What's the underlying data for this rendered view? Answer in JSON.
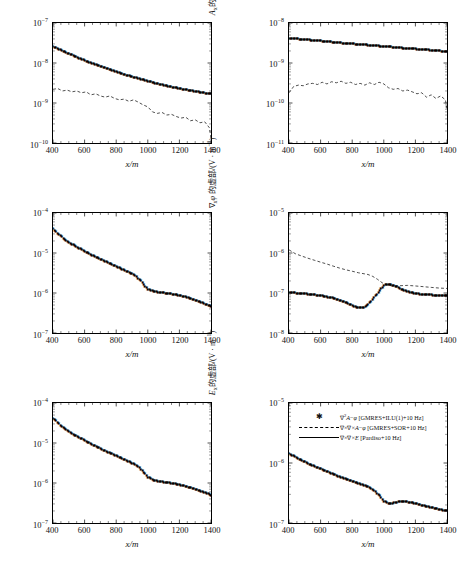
{
  "figure": {
    "xlabel": "x/m",
    "xticks": [
      400,
      600,
      800,
      1000,
      1200,
      1400
    ],
    "xlim": [
      400,
      1400
    ]
  },
  "legend": {
    "position": "top-left of bottom-right panel",
    "items": [
      {
        "symbol": "star-marker",
        "text": "∇²A−φ [GMRES+ILU(1)+10 Hz]"
      },
      {
        "symbol": "dashed-line",
        "text": "∇×∇×A−φ [GMRES+SOR+10 Hz]"
      },
      {
        "symbol": "solid-line",
        "text": "∇×∇×E [Pardiso+10 Hz]"
      }
    ]
  },
  "panels": [
    {
      "id": "panel-ax-real",
      "ylabel": "Aₓ的实部/(V · m⁻¹)",
      "yticks": [
        "-7",
        "-8",
        "-9",
        "-10"
      ],
      "ylim_exp": [
        -10,
        -7
      ],
      "chart_data": {
        "type": "line",
        "title": "Aₓ 的实部",
        "xlabel": "x/m",
        "ylabel": "Aₓ的实部/(V · m⁻¹)",
        "xlim": [
          400,
          1400
        ],
        "ylim": [
          1e-10,
          1e-07
        ],
        "yscale": "log",
        "grid": false,
        "series": [
          {
            "name": "∇²A−φ [GMRES+ILU(1)+10 Hz]",
            "style": "star-marker",
            "x": [
              400,
              450,
              500,
              550,
              600,
              650,
              700,
              750,
              800,
              850,
              900,
              950,
              1000,
              1050,
              1100,
              1150,
              1200,
              1250,
              1300,
              1350,
              1400
            ],
            "y": [
              2.6e-08,
              2.1e-08,
              1.7e-08,
              1.4e-08,
              1.15e-08,
              9.7e-09,
              8.2e-09,
              7e-09,
              6e-09,
              5.2e-09,
              4.5e-09,
              4e-09,
              3.5e-09,
              3.1e-09,
              2.8e-09,
              2.5e-09,
              2.3e-09,
              2.1e-09,
              1.95e-09,
              1.8e-09,
              1.7e-09
            ]
          },
          {
            "name": "∇×∇×A−φ [GMRES+SOR+10 Hz]",
            "style": "dashed-line",
            "x": [
              400,
              430,
              460,
              490,
              520,
              550,
              580,
              610,
              640,
              670,
              700,
              730,
              760,
              790,
              820,
              850,
              880,
              910,
              940,
              970,
              1000,
              1030,
              1060,
              1090,
              1120,
              1150,
              1180,
              1210,
              1240,
              1270,
              1300,
              1330,
              1360,
              1390,
              1400
            ],
            "y": [
              2.2e-09,
              2.3e-09,
              2e-09,
              2.1e-09,
              1.9e-09,
              2e-09,
              1.8e-09,
              1.9e-09,
              1.6e-09,
              1.7e-09,
              1.5e-09,
              1.4e-09,
              1.5e-09,
              1.3e-09,
              1.2e-09,
              1.25e-09,
              1.1e-09,
              1.2e-09,
              1.05e-09,
              9e-10,
              8e-10,
              6e-10,
              5.5e-10,
              5.8e-10,
              5e-10,
              5.2e-10,
              4.6e-10,
              4.2e-10,
              4.4e-10,
              3.6e-10,
              3.8e-10,
              3.2e-10,
              3.4e-10,
              2.4e-10,
              1.3e-10
            ]
          }
        ]
      }
    },
    {
      "id": "panel-ax-imag",
      "ylabel": "Aₓ的虚部/(V · m⁻¹)",
      "yticks": [
        "-8",
        "-9",
        "-10",
        "-11"
      ],
      "ylim_exp": [
        -11,
        -8
      ],
      "chart_data": {
        "type": "line",
        "title": "Aₓ 的虚部",
        "xlabel": "x/m",
        "ylabel": "Aₓ的虚部/(V · m⁻¹)",
        "xlim": [
          400,
          1400
        ],
        "ylim": [
          1e-11,
          1e-08
        ],
        "yscale": "log",
        "grid": false,
        "series": [
          {
            "name": "∇²A−φ [GMRES+ILU(1)+10 Hz]",
            "style": "star-marker",
            "x": [
              400,
              450,
              500,
              550,
              600,
              650,
              700,
              750,
              800,
              850,
              900,
              950,
              1000,
              1050,
              1100,
              1150,
              1200,
              1250,
              1300,
              1350,
              1400
            ],
            "y": [
              4.2e-09,
              4e-09,
              3.85e-09,
              3.7e-09,
              3.55e-09,
              3.4e-09,
              3.25e-09,
              3.1e-09,
              3e-09,
              2.9e-09,
              2.8e-09,
              2.7e-09,
              2.6e-09,
              2.5e-09,
              2.4e-09,
              2.3e-09,
              2.25e-09,
              2.15e-09,
              2.1e-09,
              2e-09,
              1.95e-09
            ]
          },
          {
            "name": "∇×∇×A−φ [GMRES+SOR+10 Hz]",
            "style": "dashed-line",
            "x": [
              400,
              430,
              460,
              490,
              520,
              550,
              580,
              610,
              640,
              670,
              700,
              730,
              760,
              790,
              820,
              850,
              880,
              910,
              940,
              970,
              1000,
              1030,
              1060,
              1090,
              1120,
              1150,
              1180,
              1210,
              1240,
              1270,
              1300,
              1330,
              1360,
              1390,
              1400
            ],
            "y": [
              1.8e-10,
              2.6e-10,
              2.8e-10,
              2.7e-10,
              3e-10,
              3.1e-10,
              2.9e-10,
              3.3e-10,
              3e-10,
              3.4e-10,
              3.2e-10,
              3.5e-10,
              3.1e-10,
              3.3e-10,
              2.9e-10,
              3.1e-10,
              2.8e-10,
              3.2e-10,
              2.9e-10,
              3.3e-10,
              3e-10,
              2.4e-10,
              2.2e-10,
              2.3e-10,
              2e-10,
              2.1e-10,
              1.9e-10,
              1.7e-10,
              1.8e-10,
              1.4e-10,
              1.6e-10,
              1.3e-10,
              1.5e-10,
              1.2e-10,
              7e-11
            ]
          }
        ]
      }
    },
    {
      "id": "panel-gradphi-real",
      "ylabel": "∇ₓφ 的实部/(V · m⁻¹)",
      "yticks": [
        "-4",
        "-5",
        "-6",
        "-7"
      ],
      "ylim_exp": [
        -7,
        -4
      ],
      "chart_data": {
        "type": "line",
        "title": "∇ₓφ 的实部",
        "xlabel": "x/m",
        "ylabel": "∇ₓφ 的实部/(V · m⁻¹)",
        "xlim": [
          400,
          1400
        ],
        "ylim": [
          1e-07,
          0.0001
        ],
        "yscale": "log",
        "grid": false,
        "series": [
          {
            "name": "∇²A−φ [GMRES+ILU(1)+10 Hz]",
            "style": "star-marker",
            "x": [
              400,
              440,
              480,
              520,
              560,
              600,
              640,
              680,
              720,
              760,
              800,
              840,
              880,
              920,
              950,
              980,
              1000,
              1020,
              1060,
              1100,
              1140,
              1180,
              1220,
              1260,
              1300,
              1340,
              1400
            ],
            "y": [
              4e-05,
              2.8e-05,
              2.1e-05,
              1.65e-05,
              1.35e-05,
              1.1e-05,
              9e-06,
              7.6e-06,
              6.4e-06,
              5.4e-06,
              4.6e-06,
              3.9e-06,
              3.3e-06,
              2.7e-06,
              2.1e-06,
              1.5e-06,
              1.25e-06,
              1.15e-06,
              1.05e-06,
              1e-06,
              9.6e-07,
              9e-07,
              8.3e-07,
              7.5e-07,
              6.6e-07,
              5.8e-07,
              4.6e-07
            ]
          }
        ]
      }
    },
    {
      "id": "panel-gradphi-imag",
      "ylabel": "∇ₓφ 的虚部/(V · m⁻¹)",
      "yticks": [
        "-5",
        "-6",
        "-7",
        "-8"
      ],
      "ylim_exp": [
        -8,
        -5
      ],
      "chart_data": {
        "type": "line",
        "title": "∇ₓφ 的虚部",
        "xlabel": "x/m",
        "ylabel": "∇ₓφ 的虚部/(V · m⁻¹)",
        "xlim": [
          400,
          1400
        ],
        "ylim": [
          1e-08,
          1e-05
        ],
        "yscale": "log",
        "grid": false,
        "series": [
          {
            "name": "∇²A−φ [GMRES+ILU(1)+10 Hz]",
            "style": "star-marker",
            "x": [
              400,
              440,
              480,
              520,
              560,
              600,
              640,
              680,
              720,
              760,
              800,
              830,
              860,
              880,
              900,
              930,
              960,
              990,
              1010,
              1030,
              1050,
              1080,
              1110,
              1150,
              1200,
              1250,
              1300,
              1350,
              1400
            ],
            "y": [
              1.02e-07,
              1e-07,
              9.7e-08,
              9.4e-08,
              9e-08,
              8.6e-08,
              8e-08,
              7.4e-08,
              6.6e-08,
              5.8e-08,
              4.9e-08,
              4.3e-08,
              4.2e-08,
              4.5e-08,
              5.2e-08,
              7e-08,
              1e-07,
              1.4e-07,
              1.6e-07,
              1.65e-07,
              1.6e-07,
              1.45e-07,
              1.25e-07,
              1.08e-07,
              9.6e-08,
              9.2e-08,
              8.9e-08,
              8.7e-08,
              8.6e-08
            ]
          },
          {
            "name": "∇×∇×A−φ [GMRES+SOR+10 Hz]",
            "style": "dashed-line",
            "x": [
              400,
              440,
              480,
              520,
              560,
              600,
              640,
              680,
              720,
              760,
              800,
              840,
              880,
              900,
              930,
              960,
              990,
              1020,
              1060,
              1100,
              1150,
              1200,
              1250,
              1300,
              1350,
              1400
            ],
            "y": [
              1.2e-06,
              9.6e-07,
              8.4e-07,
              7.4e-07,
              6.6e-07,
              5.9e-07,
              5.3e-07,
              4.7e-07,
              4.2e-07,
              3.8e-07,
              3.5e-07,
              3.2e-07,
              3e-07,
              2.9e-07,
              2.6e-07,
              2.2e-07,
              1.8e-07,
              1.6e-07,
              1.48e-07,
              1.52e-07,
              1.55e-07,
              1.5e-07,
              1.44e-07,
              1.38e-07,
              1.33e-07,
              1.3e-07
            ]
          }
        ]
      }
    },
    {
      "id": "panel-ex-real",
      "ylabel": "Eₓ的实部/(V · m⁻¹)",
      "yticks": [
        "-4",
        "-5",
        "-6",
        "-7"
      ],
      "ylim_exp": [
        -7,
        -4
      ],
      "chart_data": {
        "type": "line",
        "title": "Eₓ 的实部",
        "xlabel": "x/m",
        "ylabel": "Eₓ的实部/(V · m⁻¹)",
        "xlim": [
          400,
          1400
        ],
        "ylim": [
          1e-07,
          0.0001
        ],
        "yscale": "log",
        "grid": false,
        "series": [
          {
            "name": "∇²A−φ [GMRES+ILU(1)+10 Hz]",
            "style": "star-marker",
            "x": [
              400,
              440,
              480,
              520,
              560,
              600,
              640,
              680,
              720,
              760,
              800,
              840,
              880,
              910,
              940,
              970,
              1000,
              1030,
              1060,
              1100,
              1140,
              1180,
              1220,
              1260,
              1300,
              1340,
              1400
            ],
            "y": [
              4.2e-05,
              2.9e-05,
              2.2e-05,
              1.7e-05,
              1.4e-05,
              1.15e-05,
              9.4e-06,
              7.9e-06,
              6.6e-06,
              5.6e-06,
              4.8e-06,
              4e-06,
              3.4e-06,
              3e-06,
              2.5e-06,
              1.9e-06,
              1.4e-06,
              1.2e-06,
              1.12e-06,
              1.05e-06,
              1e-06,
              9.4e-07,
              8.6e-07,
              7.8e-07,
              6.9e-07,
              6.1e-07,
              5e-07
            ]
          }
        ]
      }
    },
    {
      "id": "panel-ex-imag",
      "ylabel": "Eₓ的虚部/(V · m⁻¹)",
      "yticks": [
        "-5",
        "-6",
        "-7"
      ],
      "ylim_exp": [
        -7,
        -5
      ],
      "chart_data": {
        "type": "line",
        "title": "Eₓ 的虚部",
        "xlabel": "x/m",
        "ylabel": "Eₓ的虚部/(V · m⁻¹)",
        "xlim": [
          400,
          1400
        ],
        "ylim": [
          1e-07,
          1e-05
        ],
        "yscale": "log",
        "grid": false,
        "series": [
          {
            "name": "∇²A−φ [GMRES+ILU(1)+10 Hz]",
            "style": "star-marker",
            "x": [
              400,
              440,
              480,
              520,
              560,
              600,
              640,
              680,
              720,
              760,
              800,
              840,
              880,
              910,
              940,
              970,
              1000,
              1030,
              1060,
              1090,
              1120,
              1150,
              1200,
              1250,
              1300,
              1350,
              1400
            ],
            "y": [
              1.45e-06,
              1.25e-06,
              1.1e-06,
              9.8e-07,
              8.8e-07,
              8e-07,
              7.2e-07,
              6.5e-07,
              5.9e-07,
              5.4e-07,
              5e-07,
              4.6e-07,
              4.2e-07,
              3.9e-07,
              3.4e-07,
              2.9e-07,
              2.3e-07,
              2.1e-07,
              2.15e-07,
              2.25e-07,
              2.3e-07,
              2.25e-07,
              2.1e-07,
              1.95e-07,
              1.8e-07,
              1.68e-07,
              1.6e-07
            ]
          }
        ]
      }
    }
  ]
}
